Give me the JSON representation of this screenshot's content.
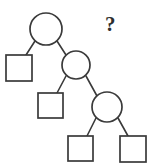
{
  "figure": {
    "type": "binary-tree-diagram",
    "background_color": "#ffffff",
    "stroke_color": "#3a3a3a",
    "fill_color": "#ffffff",
    "annotation": {
      "text": "?",
      "x": 105,
      "y": 14,
      "color": "#2e2e2e"
    },
    "nodes": [
      {
        "id": "circle-1",
        "shape": "circle",
        "label": "",
        "cx": 46,
        "cy": 29,
        "r": 16
      },
      {
        "id": "square-1",
        "shape": "square",
        "label": "",
        "x": 6,
        "y": 55,
        "size": 26
      },
      {
        "id": "circle-2",
        "shape": "circle",
        "label": "",
        "cx": 76,
        "cy": 65,
        "r": 14
      },
      {
        "id": "square-2",
        "shape": "square",
        "label": "",
        "x": 38,
        "y": 93,
        "size": 25
      },
      {
        "id": "circle-3",
        "shape": "circle",
        "label": "",
        "cx": 107,
        "cy": 107,
        "r": 15
      },
      {
        "id": "square-3",
        "shape": "square",
        "label": "",
        "x": 68,
        "y": 136,
        "size": 25
      },
      {
        "id": "square-4",
        "shape": "square",
        "label": "",
        "x": 120,
        "y": 136,
        "size": 26
      }
    ],
    "edges": [
      {
        "from": "circle-1",
        "to": "square-1",
        "x1": 35,
        "y1": 41,
        "x2": 26,
        "y2": 55
      },
      {
        "from": "circle-1",
        "to": "circle-2",
        "x1": 57,
        "y1": 41,
        "x2": 66,
        "y2": 55
      },
      {
        "from": "circle-2",
        "to": "square-2",
        "x1": 66,
        "y1": 76,
        "x2": 57,
        "y2": 93
      },
      {
        "from": "circle-2",
        "to": "circle-3",
        "x1": 86,
        "y1": 76,
        "x2": 97,
        "y2": 96
      },
      {
        "from": "circle-3",
        "to": "square-3",
        "x1": 96,
        "y1": 118,
        "x2": 87,
        "y2": 136
      },
      {
        "from": "circle-3",
        "to": "square-4",
        "x1": 118,
        "y1": 118,
        "x2": 128,
        "y2": 136
      }
    ]
  }
}
